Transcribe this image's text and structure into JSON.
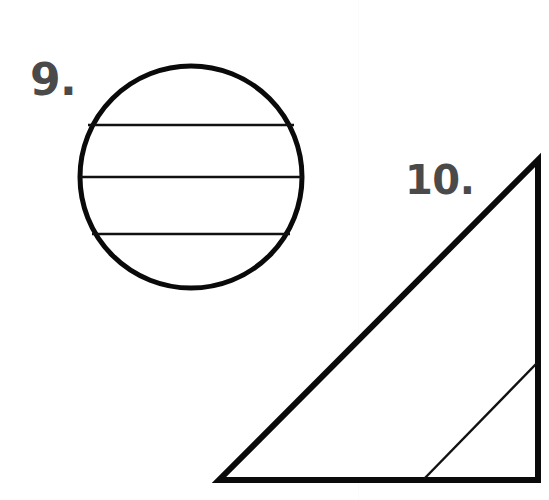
{
  "page": {
    "background_color": "#ffffff",
    "width": 549,
    "height": 500
  },
  "ink": {
    "outline_color": "#0a0a0a",
    "divider_color": "#111111",
    "label_color": "#4a4a4a",
    "seam_color": "#fbfbfb"
  },
  "problems": [
    {
      "number": "9.",
      "shape": "circle",
      "label_position": {
        "x": 30,
        "y": 58
      },
      "label_font_size": 44,
      "geometry": {
        "center_x": 191,
        "center_y": 177,
        "radius": 111,
        "stroke_width": 5
      },
      "dividers": {
        "orientation": "horizontal",
        "count": 3,
        "stroke_width": 2,
        "y_values": [
          125,
          177,
          234
        ]
      },
      "parts": 4,
      "shaded_parts": 0
    },
    {
      "number": "10.",
      "shape": "right-triangle",
      "label_position": {
        "x": 405,
        "y": 160
      },
      "label_font_size": 40,
      "geometry": {
        "apex_x": 538,
        "apex_y": 160,
        "bottom_left_x": 219,
        "bottom_left_y": 480,
        "bottom_right_x": 538,
        "bottom_right_y": 480,
        "stroke_width": 6
      },
      "dividers": {
        "orientation": "diagonal",
        "count": 1,
        "stroke_width": 2,
        "segments": [
          {
            "x1": 424,
            "y1": 480,
            "x2": 538,
            "y2": 363
          }
        ]
      },
      "parts": 2,
      "shaded_parts": 0
    }
  ],
  "artifacts": {
    "scan_seam_x": 358
  }
}
